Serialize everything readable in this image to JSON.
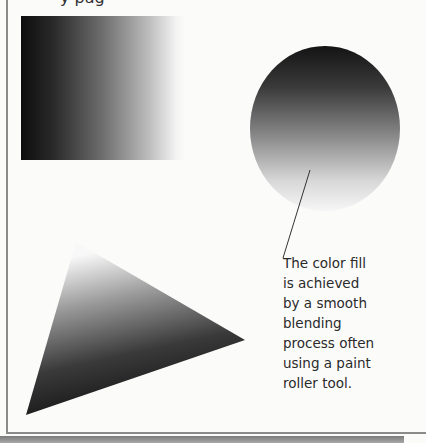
{
  "page": {
    "top_text_fragment": "y pag"
  },
  "figures": {
    "rectangle": {
      "shape": "rectangle",
      "gradient": "dark-left-to-light-right"
    },
    "oval": {
      "shape": "oval",
      "gradient": "dark-top-to-light-bottom"
    },
    "triangle": {
      "shape": "triangle",
      "gradient": "light-top-to-dark-bottom-right"
    }
  },
  "caption": {
    "lines": [
      "The color fill",
      "is achieved",
      "by a smooth",
      "blending",
      "process often",
      "using a paint",
      "roller tool."
    ]
  },
  "colors": {
    "background": "#fbfbfa",
    "text": "#2a2a2a",
    "border": "#8a8a8a"
  }
}
